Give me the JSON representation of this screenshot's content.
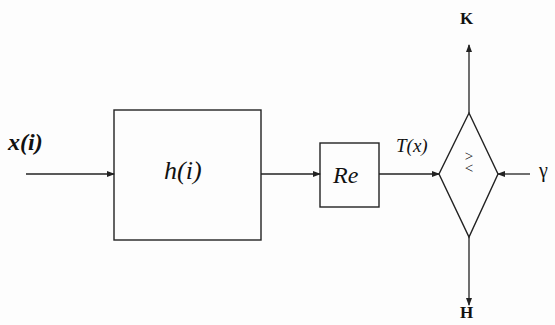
{
  "diagram": {
    "type": "block-diagram",
    "colors": {
      "stroke": "#222222",
      "background": "#fdfdfd",
      "text": "#111111"
    },
    "input": {
      "label": "x(i)"
    },
    "blocks": [
      {
        "id": "filter",
        "label": "h(i)"
      },
      {
        "id": "real",
        "label": "Re"
      }
    ],
    "signal": {
      "label": "T(x)"
    },
    "comparator": {
      "symbol_top": ">",
      "symbol_bottom": "<"
    },
    "threshold": {
      "label": "γ"
    },
    "outputs": {
      "top": "K",
      "bottom": "H"
    }
  }
}
